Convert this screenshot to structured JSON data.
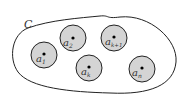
{
  "region_label": "C",
  "colors": {
    "disk_fill": "#d4d4d4",
    "stroke": "#222222"
  },
  "disks": [
    {
      "id": "a1",
      "base": "a",
      "sub": "1",
      "cx": 44,
      "cy": 55
    },
    {
      "id": "a2",
      "base": "a",
      "sub": "2",
      "cx": 73,
      "cy": 38
    },
    {
      "id": "ak",
      "base": "a",
      "sub": "k",
      "cx": 89,
      "cy": 68
    },
    {
      "id": "ak1",
      "base": "a",
      "sub": "k+1",
      "cx": 114,
      "cy": 38
    },
    {
      "id": "an",
      "base": "a",
      "sub": "n",
      "cx": 142,
      "cy": 68
    }
  ]
}
